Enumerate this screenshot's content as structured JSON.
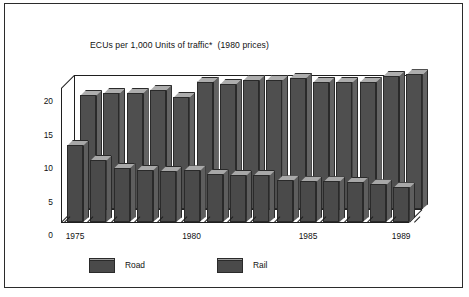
{
  "chart_data": {
    "type": "bar",
    "title": "ECUs per 1,000 Units of traffic*  (1980 prices)",
    "xlabel": "",
    "ylabel": "",
    "ylim": [
      0,
      22
    ],
    "yticks": [
      "0",
      "5",
      "10",
      "15",
      "20"
    ],
    "ytick_values": [
      0,
      5,
      10,
      15,
      20
    ],
    "grid": false,
    "legend_position": "bottom-left",
    "projection": "3d-two-row",
    "categories": [
      "1975",
      "1976",
      "1977",
      "1978",
      "1979",
      "1980",
      "1981",
      "1982",
      "1983",
      "1984",
      "1985",
      "1986",
      "1987",
      "1988",
      "1989"
    ],
    "xtick_labels": [
      "1975",
      "1980",
      "1985",
      "1989"
    ],
    "xtick_categories": [
      "1975",
      "1980",
      "1985",
      "1989"
    ],
    "series": [
      {
        "name": "Road",
        "row": "front",
        "color": "#4a4a4a",
        "values": [
          11.5,
          9.3,
          8.1,
          7.8,
          7.6,
          7.7,
          7.2,
          7.0,
          7.0,
          6.2,
          6.1,
          6.1,
          6.0,
          5.6,
          5.2
        ]
      },
      {
        "name": "Rail",
        "row": "back",
        "color": "#4f4f4f",
        "values": [
          17.0,
          17.3,
          17.3,
          17.8,
          16.7,
          19.0,
          18.7,
          19.3,
          19.3,
          19.6,
          19.0,
          19.0,
          19.0,
          19.9,
          20.1
        ]
      }
    ]
  },
  "legend": {
    "items": [
      {
        "label": "Road",
        "color": "#4a4a4a"
      },
      {
        "label": "Rail",
        "color": "#4f4f4f"
      }
    ]
  },
  "footnote": ""
}
